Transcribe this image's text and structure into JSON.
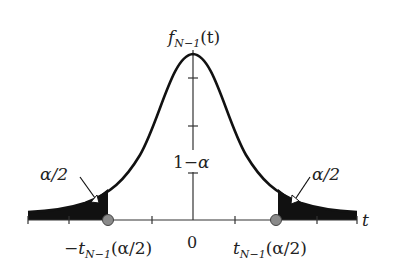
{
  "diagram": {
    "y_axis_label": "f_{N-1}(t)",
    "x_axis_label": "t",
    "center_label": "1−α",
    "origin_label": "0",
    "left_tail_label": "α/2",
    "right_tail_label": "α/2",
    "left_critical_label": "−t_{N−1}(α/2)",
    "right_critical_label": "t_{N−1}(α/2)",
    "labels": {
      "f": "f",
      "N1": "N−1",
      "t_paren": "(t)",
      "t": "t",
      "one_minus": "1−",
      "alpha": "α",
      "zero": "0",
      "alpha_half": "α/2",
      "neg": "−",
      "crit_arg": "(α/2)"
    },
    "colors": {
      "curve": "#111111",
      "tail_fill": "#111111",
      "axis": "#333333",
      "marker_fill": "#8a8a8a",
      "marker_stroke": "#444444"
    },
    "x_ticks_px": [
      28,
      69,
      152,
      235,
      317,
      357
    ],
    "y_ticks_px": [
      78,
      126
    ]
  }
}
